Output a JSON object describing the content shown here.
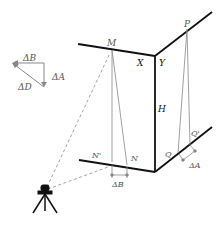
{
  "diagram": {
    "labels": {
      "M": "M",
      "P": "P",
      "X": "X",
      "Y": "Y",
      "H": "H",
      "N_prime": "N'",
      "N": "N",
      "Q": "Q",
      "Q_prime": "Q'",
      "delta_B_bottom": "ΔB",
      "delta_A_right": "ΔA",
      "vector_delta_B": "ΔB",
      "vector_delta_A": "ΔA",
      "vector_delta_D": "ΔD"
    },
    "colors": {
      "structure": "#111111",
      "projection": "#888888",
      "sightline": "#999999",
      "label": "#555555"
    }
  }
}
